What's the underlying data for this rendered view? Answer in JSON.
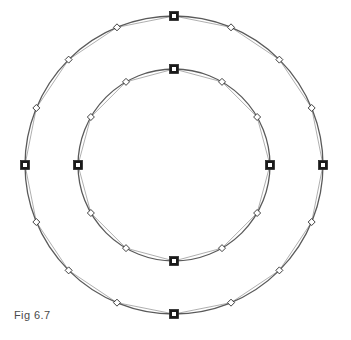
{
  "figure": {
    "caption": "Fig 6.7",
    "background_color": "#ffffff",
    "center": {
      "x": 174,
      "y": 165
    },
    "colors": {
      "circle_stroke": "#5a5a5a",
      "polygon_stroke": "#9a9a9a",
      "marker_stroke": "#2b2b2b",
      "square_fill": "#1a1a1a",
      "square_inner_fill": "#ffffff",
      "diamond_fill": "#ffffff",
      "caption_text": "#4a4a4a"
    },
    "rings": [
      {
        "name": "outer-ring",
        "radius": 149,
        "point_count": 16,
        "square_count": 4,
        "diamond_count": 12,
        "square_angles_deg": [
          0,
          90,
          180,
          270
        ],
        "diamond_angles_deg": [
          22.5,
          45,
          67.5,
          112.5,
          135,
          157.5,
          202.5,
          225,
          247.5,
          292.5,
          315,
          337.5
        ],
        "square_size": 9,
        "diamond_size": 7,
        "circle_stroke_width": 1.3,
        "polygon_stroke_width": 0.8
      },
      {
        "name": "inner-ring",
        "radius": 96,
        "point_count": 12,
        "square_count": 4,
        "diamond_count": 8,
        "square_angles_deg": [
          0,
          90,
          180,
          270
        ],
        "diamond_angles_deg": [
          30,
          60,
          120,
          150,
          210,
          240,
          300,
          330
        ],
        "square_size": 9,
        "diamond_size": 7,
        "circle_stroke_width": 1.3,
        "polygon_stroke_width": 0.8
      }
    ]
  }
}
